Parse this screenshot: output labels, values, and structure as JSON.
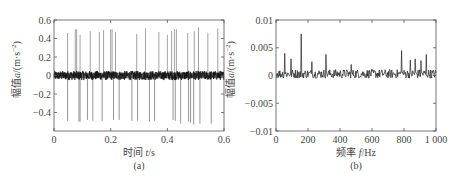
{
  "chart_data": [
    {
      "type": "line",
      "panel": "(a)",
      "caption": "(a)",
      "xlabel": "时间 t/s",
      "xlabel_parts": {
        "cn": "时间",
        "var": "t",
        "unit": "/s"
      },
      "ylabel": "幅值a/(m·s⁻²)",
      "ylabel_parts": {
        "cn": "幅值",
        "var": "a",
        "unit": "/(m·s",
        "sup": "−2",
        "close": ")"
      },
      "xlim": [
        0,
        0.6
      ],
      "ylim": [
        -0.6,
        0.6
      ],
      "xticks": [
        0,
        0.2,
        0.4,
        0.6
      ],
      "xtick_labels": [
        "0",
        "0.2",
        "0.4",
        "0.6"
      ],
      "yticks": [
        0.6,
        0.4,
        0.2,
        0,
        -0.2,
        -0.4
      ],
      "ytick_labels": [
        "0.6",
        "0.4",
        "0.2",
        "0",
        "−0.2",
        "−0.4"
      ],
      "grid": false,
      "description": "Time-domain vibration signal: dense noise band around 0 (about ±0.05) with periodic impulse spikes of ~±0.5",
      "noise_amplitude": 0.05,
      "spikes_positive": [
        {
          "t": 0.048,
          "a": 0.46
        },
        {
          "t": 0.075,
          "a": 0.5
        },
        {
          "t": 0.08,
          "a": 0.5
        },
        {
          "t": 0.092,
          "a": 0.44
        },
        {
          "t": 0.128,
          "a": 0.48
        },
        {
          "t": 0.16,
          "a": 0.47
        },
        {
          "t": 0.175,
          "a": 0.49
        },
        {
          "t": 0.2,
          "a": 0.5
        },
        {
          "t": 0.205,
          "a": 0.5
        },
        {
          "t": 0.217,
          "a": 0.47
        },
        {
          "t": 0.292,
          "a": 0.45
        },
        {
          "t": 0.323,
          "a": 0.51
        },
        {
          "t": 0.37,
          "a": 0.47
        },
        {
          "t": 0.4,
          "a": 0.44
        },
        {
          "t": 0.415,
          "a": 0.48
        },
        {
          "t": 0.425,
          "a": 0.5
        },
        {
          "t": 0.432,
          "a": 0.5
        },
        {
          "t": 0.472,
          "a": 0.46
        },
        {
          "t": 0.495,
          "a": 0.48
        },
        {
          "t": 0.51,
          "a": 0.52
        },
        {
          "t": 0.543,
          "a": 0.46
        },
        {
          "t": 0.578,
          "a": 0.51
        }
      ],
      "spikes_negative": [
        {
          "t": 0.048,
          "a": -0.49
        },
        {
          "t": 0.088,
          "a": -0.5
        },
        {
          "t": 0.092,
          "a": -0.5
        },
        {
          "t": 0.118,
          "a": -0.48
        },
        {
          "t": 0.137,
          "a": -0.49
        },
        {
          "t": 0.17,
          "a": -0.49
        },
        {
          "t": 0.21,
          "a": -0.48
        },
        {
          "t": 0.23,
          "a": -0.48
        },
        {
          "t": 0.275,
          "a": -0.49
        },
        {
          "t": 0.295,
          "a": -0.49
        },
        {
          "t": 0.337,
          "a": -0.5
        },
        {
          "t": 0.355,
          "a": -0.49
        },
        {
          "t": 0.42,
          "a": -0.48
        },
        {
          "t": 0.428,
          "a": -0.49
        },
        {
          "t": 0.447,
          "a": -0.52
        },
        {
          "t": 0.475,
          "a": -0.5
        },
        {
          "t": 0.482,
          "a": -0.51
        },
        {
          "t": 0.493,
          "a": -0.53
        },
        {
          "t": 0.515,
          "a": -0.52
        },
        {
          "t": 0.555,
          "a": -0.52
        }
      ]
    },
    {
      "type": "line",
      "panel": "(b)",
      "caption": "(b)",
      "xlabel": "频率 f/Hz",
      "xlabel_parts": {
        "cn": "频率",
        "var": "f",
        "unit": "/Hz"
      },
      "ylabel": "幅值a/(m·s⁻²)",
      "ylabel_parts": {
        "cn": "幅值",
        "var": "a",
        "unit": "/(m·s",
        "sup": "−2",
        "close": ")"
      },
      "xlim": [
        0,
        1000
      ],
      "ylim": [
        -0.01,
        0.01
      ],
      "xticks": [
        0,
        200,
        400,
        600,
        800,
        1000
      ],
      "xtick_labels": [
        "0",
        "200",
        "400",
        "600",
        "800",
        "1 000"
      ],
      "yticks": [
        0.01,
        0.005,
        0,
        -0.005,
        -0.01
      ],
      "ytick_labels": [
        "0.01",
        "0.005",
        "0",
        "−0.005",
        "−0.01"
      ],
      "grid": false,
      "description": "Frequency spectrum: noisy baseline around 0 to 0.001 with peaks",
      "noise_amplitude": 0.0008,
      "peaks": [
        {
          "f": 55,
          "a": 0.004
        },
        {
          "f": 95,
          "a": 0.003
        },
        {
          "f": 158,
          "a": 0.0075
        },
        {
          "f": 225,
          "a": 0.0025
        },
        {
          "f": 312,
          "a": 0.0038
        },
        {
          "f": 470,
          "a": 0.002
        },
        {
          "f": 785,
          "a": 0.0045
        },
        {
          "f": 840,
          "a": 0.0028
        },
        {
          "f": 870,
          "a": 0.003
        },
        {
          "f": 905,
          "a": 0.0027
        },
        {
          "f": 940,
          "a": 0.0038
        }
      ]
    }
  ],
  "layout": {
    "panels": [
      {
        "x0": 54,
        "x1": 224,
        "y0": 20,
        "y1": 131
      },
      {
        "x0": 276,
        "x1": 436,
        "y0": 20,
        "y1": 131
      }
    ]
  }
}
